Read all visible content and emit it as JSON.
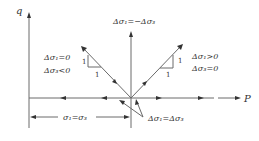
{
  "diagram": {
    "axes": {
      "vertical_label": "q",
      "horizontal_label": "P"
    },
    "paths": [
      {
        "id": "vertical",
        "label": "Δσ₁=−Δσ₃",
        "direction": "up"
      },
      {
        "id": "up-left",
        "label_line1": "Δσ₁=0",
        "label_line2": "Δσ₃<0",
        "slope_rise": "1",
        "slope_run": "1",
        "direction": "up-left"
      },
      {
        "id": "up-right",
        "label_line1": "Δσ₁>0",
        "label_line2": "Δσ₃=0",
        "slope_rise": "1",
        "slope_run": "1",
        "direction": "up-right"
      },
      {
        "id": "horizontal",
        "label": "Δσ₁=Δσ₃",
        "direction": "left-right"
      }
    ],
    "dimension": {
      "label": "σ₁=σ₃"
    },
    "colors": {
      "line": "#6a6a6a",
      "text": "#333333",
      "background": "#ffffff"
    }
  }
}
